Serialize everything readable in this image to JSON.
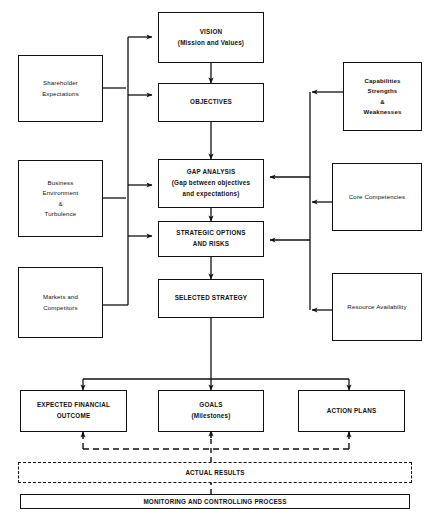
{
  "diagram": {
    "type": "flowchart",
    "line_color": "#111111",
    "background": "#ffffff",
    "inputs_left": [
      {
        "id": "shareholder-expectations",
        "lines": [
          "Shareholder",
          "Expectations"
        ]
      },
      {
        "id": "business-environment",
        "lines": [
          "Business",
          "Environment",
          "&",
          "Turbulence"
        ]
      },
      {
        "id": "markets-competitors",
        "lines": [
          "Markets and",
          "Competitors"
        ]
      }
    ],
    "center_chain": [
      {
        "id": "vision",
        "lines": [
          "VISION",
          "(Mission and Values)"
        ]
      },
      {
        "id": "objectives",
        "lines": [
          "OBJECTIVES"
        ]
      },
      {
        "id": "gap-analysis",
        "lines": [
          "GAP ANALYSIS",
          "(Gap between objectives",
          "and expectations)"
        ]
      },
      {
        "id": "strategic-options",
        "lines": [
          "STRATEGIC OPTIONS",
          "AND RISKS"
        ]
      },
      {
        "id": "selected-strategy",
        "lines": [
          "SELECTED STRATEGY"
        ]
      }
    ],
    "inputs_right": [
      {
        "id": "capabilities",
        "lines": [
          "Capabilities",
          "Strengths",
          "&",
          "Weaknesses"
        ]
      },
      {
        "id": "core-competencies",
        "lines": [
          "Core Competencies"
        ]
      },
      {
        "id": "resource-availability",
        "lines": [
          "Resource Availability"
        ]
      }
    ],
    "outputs_bottom": [
      {
        "id": "expected-financial-outcome",
        "lines": [
          "EXPECTED FINANCIAL",
          "OUTCOME"
        ]
      },
      {
        "id": "goals",
        "lines": [
          "GOALS",
          "(Milestones)"
        ]
      },
      {
        "id": "action-plans",
        "lines": [
          "ACTION PLANS"
        ]
      }
    ],
    "feedback": {
      "actual_results": "ACTUAL RESULTS",
      "monitoring": "MONITORING AND CONTROLLING PROCESS"
    },
    "caption": ""
  }
}
